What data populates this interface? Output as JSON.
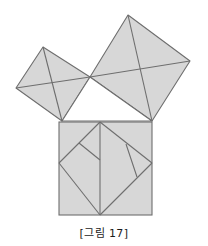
{
  "figure": {
    "caption": "[그림 17]",
    "colors": {
      "fill": "#d7d7d7",
      "stroke": "#6e6e6e",
      "background": "#ffffff",
      "caption_text": "#1a1a1a"
    },
    "stroke_width": 1.1,
    "canvas": {
      "width": 208,
      "height": 246,
      "diagram_height": 224
    },
    "geometry": {
      "right_triangle": {
        "name": "central-right-triangle",
        "filled": false,
        "vertices": [
          {
            "label": "C",
            "x": 90,
            "y": 77
          },
          {
            "label": "A",
            "x": 62,
            "y": 121
          },
          {
            "label": "B",
            "x": 152,
            "y": 121
          }
        ]
      },
      "square_large": {
        "name": "hypotenuse-square",
        "side_label": "c",
        "vertices": [
          {
            "x": 90,
            "y": 77
          },
          {
            "x": 128,
            "y": 15
          },
          {
            "x": 190,
            "y": 61
          },
          {
            "x": 152,
            "y": 121
          }
        ],
        "center": {
          "x": 140,
          "y": 68.5
        },
        "cut_lines": [
          {
            "name": "cross-horizontal",
            "x1": 90,
            "y1": 77,
            "x2": 190,
            "y2": 61
          },
          {
            "name": "cross-vertical",
            "x1": 128,
            "y1": 15,
            "x2": 152,
            "y2": 121
          }
        ]
      },
      "square_small": {
        "name": "leg-square-upper-left",
        "side_label": "b",
        "vertices": [
          {
            "x": 90,
            "y": 77
          },
          {
            "x": 43,
            "y": 47
          },
          {
            "x": 16,
            "y": 88
          },
          {
            "x": 62,
            "y": 121
          }
        ],
        "center": {
          "x": 52.75,
          "y": 83.25
        },
        "cut_lines": [
          {
            "name": "cross-horizontal",
            "x1": 90,
            "y1": 77,
            "x2": 16,
            "y2": 88
          },
          {
            "name": "cross-vertical",
            "x1": 43,
            "y1": 47,
            "x2": 62,
            "y2": 121
          }
        ]
      },
      "square_bottom": {
        "name": "leg-square-bottom",
        "side_label": "a",
        "vertices": [
          {
            "x": 59,
            "y": 122
          },
          {
            "x": 152,
            "y": 122
          },
          {
            "x": 152,
            "y": 215
          },
          {
            "x": 59,
            "y": 215
          }
        ],
        "cut_lines": [
          {
            "name": "dissection-edge-1",
            "x1": 100,
            "y1": 122,
            "x2": 152,
            "y2": 163
          },
          {
            "name": "dissection-edge-2",
            "x1": 100,
            "y1": 122,
            "x2": 59,
            "y2": 163
          },
          {
            "name": "dissection-edge-3",
            "x1": 59,
            "y1": 163,
            "x2": 100,
            "y2": 215
          },
          {
            "name": "dissection-edge-4",
            "x1": 100,
            "y1": 215,
            "x2": 152,
            "y2": 163
          },
          {
            "name": "median-vertical",
            "x1": 100,
            "y1": 122,
            "x2": 100,
            "y2": 215
          },
          {
            "name": "notch-upper-left",
            "x1": 79,
            "y1": 143,
            "x2": 100,
            "y2": 160
          },
          {
            "name": "notch-right",
            "x1": 126,
            "y1": 144,
            "x2": 137,
            "y2": 177
          }
        ]
      }
    }
  }
}
